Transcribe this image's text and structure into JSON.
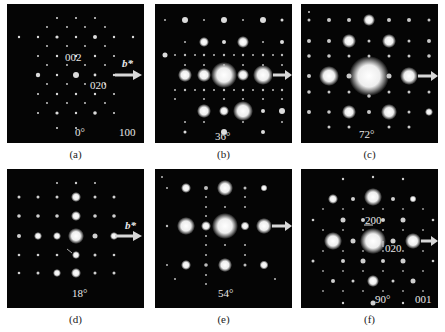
{
  "figure": {
    "arrow_color": "#d8d8d8",
    "background": "#050505",
    "panels": [
      {
        "id": "a",
        "caption": "(a)",
        "angle": "0°",
        "zone": "100",
        "spot_labels": [
          "002",
          "020"
        ],
        "axis_label": "b*",
        "x": 7,
        "y": 4
      },
      {
        "id": "b",
        "caption": "(b)",
        "angle": "36°",
        "zone": "",
        "spot_labels": [],
        "axis_label": "",
        "x": 155,
        "y": 4
      },
      {
        "id": "c",
        "caption": "(c)",
        "angle": "72°",
        "zone": "",
        "spot_labels": [],
        "axis_label": "",
        "x": 301,
        "y": 4
      },
      {
        "id": "d",
        "caption": "(d)",
        "angle": "18°",
        "zone": "",
        "spot_labels": [],
        "axis_label": "b*",
        "x": 7,
        "y": 169
      },
      {
        "id": "e",
        "caption": "(e)",
        "angle": "54°",
        "zone": "",
        "spot_labels": [],
        "axis_label": "",
        "x": 155,
        "y": 169
      },
      {
        "id": "f",
        "caption": "(f)",
        "angle": "90°",
        "zone": "001",
        "spot_labels": [
          "200",
          "020"
        ],
        "axis_label": "",
        "x": 301,
        "y": 169
      }
    ]
  }
}
